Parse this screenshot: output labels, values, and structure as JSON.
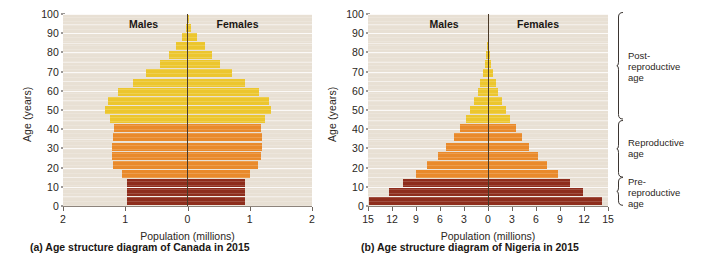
{
  "figure": {
    "axis_title_y": "Age (years)",
    "axis_title_x": "Population (millions)",
    "label_males": "Males",
    "label_females": "Females"
  },
  "colors": {
    "pre_reproductive": "#8e2d1c",
    "reproductive": "#e98a2b",
    "post_reproductive": "#ecc62e",
    "plot_background": "#e8e0d4",
    "gridline": "#ffffff",
    "divider": "#4a3a28",
    "axis": "#8d847c",
    "text": "#231f1c"
  },
  "brackets": [
    {
      "id": "post-reproductive",
      "label": "Post-\nreproductive\nage",
      "age_from": 45,
      "age_to": 100
    },
    {
      "id": "reproductive",
      "label": "Reproductive\nage",
      "age_from": 15,
      "age_to": 44
    },
    {
      "id": "pre-reproductive",
      "label": "Pre-\nreproductive\nage",
      "age_from": 0,
      "age_to": 14
    }
  ],
  "panels": [
    {
      "id": "canada",
      "caption": "(a) Age structure diagram of Canada in 2015",
      "chart_data": {
        "type": "bar",
        "subtype": "population-pyramid",
        "title": "(a) Age structure diagram of Canada in 2015",
        "xlabel": "Population (millions)",
        "ylabel": "Age (years)",
        "xlim": [
          -2,
          2
        ],
        "ylim": [
          0,
          100
        ],
        "xticks": [
          2,
          1,
          0,
          1,
          2
        ],
        "xtick_values": [
          -2,
          -1,
          0,
          1,
          2
        ],
        "yticks": [
          0,
          10,
          20,
          30,
          40,
          50,
          60,
          70,
          80,
          90,
          100
        ],
        "grid": true,
        "legend": "none",
        "units": "millions",
        "categories": [
          "0-4",
          "5-9",
          "10-14",
          "15-19",
          "20-24",
          "25-29",
          "30-34",
          "35-39",
          "40-44",
          "45-49",
          "50-54",
          "55-59",
          "60-64",
          "65-69",
          "70-74",
          "75-79",
          "80-84",
          "85-89",
          "90-94",
          "95-99",
          "100+"
        ],
        "series": [
          {
            "name": "Males",
            "side": "left",
            "values": [
              0.97,
              0.98,
              0.98,
              1.06,
              1.2,
              1.21,
              1.21,
              1.2,
              1.18,
              1.24,
              1.33,
              1.28,
              1.11,
              0.88,
              0.66,
              0.45,
              0.3,
              0.19,
              0.09,
              0.03,
              0.01
            ]
          },
          {
            "name": "Females",
            "side": "right",
            "values": [
              0.92,
              0.93,
              0.93,
              1.01,
              1.14,
              1.18,
              1.2,
              1.2,
              1.18,
              1.25,
              1.34,
              1.31,
              1.15,
              0.93,
              0.72,
              0.53,
              0.39,
              0.28,
              0.16,
              0.06,
              0.02
            ]
          }
        ],
        "band_colors": {
          "0-14": "#8e2d1c",
          "15-44": "#e98a2b",
          "45-100+": "#ecc62e"
        }
      }
    },
    {
      "id": "nigeria",
      "caption": "(b) Age structure diagram of Nigeria in 2015",
      "chart_data": {
        "type": "bar",
        "subtype": "population-pyramid",
        "title": "(b) Age structure diagram of Nigeria in 2015",
        "xlabel": "Population (millions)",
        "ylabel": "Age (years)",
        "xlim": [
          -15,
          15
        ],
        "ylim": [
          0,
          100
        ],
        "xticks": [
          15,
          12,
          9,
          6,
          3,
          0,
          3,
          6,
          9,
          12,
          15
        ],
        "xtick_values": [
          -15,
          -12,
          -9,
          -6,
          -3,
          0,
          3,
          6,
          9,
          12,
          15
        ],
        "yticks": [
          0,
          10,
          20,
          30,
          40,
          50,
          60,
          70,
          80,
          90,
          100
        ],
        "grid": true,
        "legend": "none",
        "units": "millions",
        "categories": [
          "0-4",
          "5-9",
          "10-14",
          "15-19",
          "20-24",
          "25-29",
          "30-34",
          "35-39",
          "40-44",
          "45-49",
          "50-54",
          "55-59",
          "60-64",
          "65-69",
          "70-74",
          "75-79",
          "80-84",
          "85-89",
          "90-94",
          "95-99",
          "100+"
        ],
        "series": [
          {
            "name": "Males",
            "side": "left",
            "values": [
              14.9,
              12.4,
              10.6,
              9.0,
              7.6,
              6.3,
              5.2,
              4.3,
              3.5,
              2.8,
              2.2,
              1.7,
              1.3,
              0.95,
              0.65,
              0.4,
              0.22,
              0.1,
              0.04,
              0.01,
              0.0
            ]
          },
          {
            "name": "Females",
            "side": "right",
            "values": [
              14.3,
              11.9,
              10.2,
              8.7,
              7.4,
              6.2,
              5.1,
              4.2,
              3.5,
              2.8,
              2.2,
              1.7,
              1.3,
              0.98,
              0.68,
              0.43,
              0.24,
              0.11,
              0.04,
              0.01,
              0.0
            ]
          }
        ],
        "band_colors": {
          "0-14": "#8e2d1c",
          "15-44": "#e98a2b",
          "45-100+": "#ecc62e"
        }
      }
    }
  ]
}
